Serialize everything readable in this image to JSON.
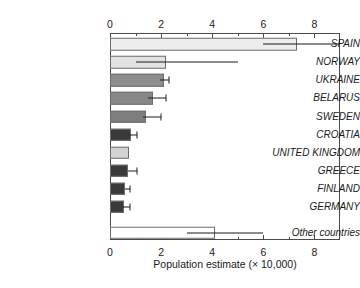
{
  "chart_data": {
    "type": "bar",
    "orientation": "horizontal",
    "title": "",
    "xlabel": "Population estimate (× 10,000)",
    "ylabel": "",
    "xlim": [
      0,
      9
    ],
    "ylim": [
      0,
      11
    ],
    "grid": false,
    "legend": false,
    "axes": {
      "top_axis": true,
      "bottom_axis": true,
      "major_ticks": [
        0,
        2,
        4,
        6,
        8
      ],
      "minor_ticks": [
        1,
        3,
        5,
        7
      ],
      "tick_labels": [
        "0",
        "2",
        "4",
        "6",
        "8"
      ]
    },
    "categories": [
      "SPAIN",
      "NORWAY",
      "UKRAINE",
      "BELARUS",
      "SWEDEN",
      "CROATIA",
      "UNITED KINGDOM",
      "GREECE",
      "FINLAND",
      "GERMANY",
      "Other countries"
    ],
    "values": [
      7.3,
      2.2,
      2.1,
      1.7,
      1.4,
      0.82,
      0.75,
      0.7,
      0.6,
      0.55,
      4.1
    ],
    "error_low": [
      6.0,
      1.0,
      1.95,
      1.5,
      1.3,
      0.8,
      null,
      0.7,
      0.6,
      0.5,
      3.0
    ],
    "error_high": [
      9.0,
      5.0,
      2.3,
      2.2,
      2.0,
      1.05,
      null,
      1.05,
      0.8,
      0.8,
      6.0
    ],
    "bar_colors": [
      "#ededed",
      "#e2e2e2",
      "#8e8e8e",
      "#888888",
      "#7e7e7e",
      "#3a3a3a",
      "#d3d3d3",
      "#3a3a3a",
      "#3a3a3a",
      "#3a3a3a",
      "#ffffff"
    ],
    "bar_edge_color": "#6d6d6d",
    "error_color": "#1a1a1a",
    "axis_color": "#4a4a4a",
    "background": "#ffffff"
  }
}
